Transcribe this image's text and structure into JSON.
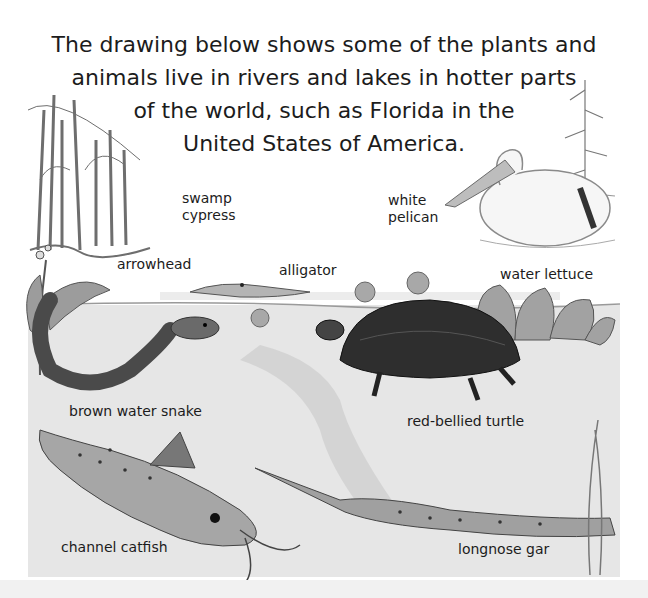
{
  "intro": {
    "lines": [
      "The drawing below shows some of the plants and",
      "animals live in rivers and lakes in hotter parts",
      "of the world, such as Florida in the",
      "United States of America."
    ]
  },
  "labels": {
    "swamp_cypress": [
      "swamp",
      "cypress"
    ],
    "white_pelican": [
      "white",
      "pelican"
    ],
    "arrowhead": "arrowhead",
    "alligator": "alligator",
    "water_lettuce": "water lettuce",
    "brown_water_snake": "brown water snake",
    "red_bellied_turtle": "red-bellied turtle",
    "channel_catfish": "channel catfish",
    "longnose_gar": "longnose gar"
  },
  "colors": {
    "text": "#1c1c1c",
    "water": "#e2e2e2",
    "shade_dark": "#3a3a3a",
    "shade_mid": "#8a8a8a",
    "shade_light": "#c8c8c8"
  }
}
